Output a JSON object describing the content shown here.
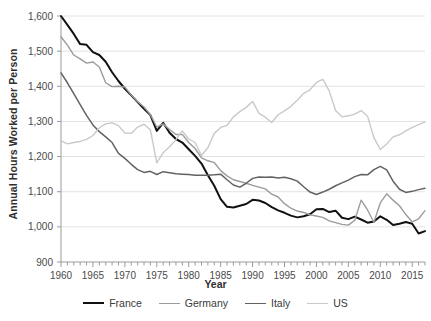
{
  "chart_data": {
    "type": "line",
    "title": "",
    "xlabel": "Year",
    "ylabel": "Annual Hours Worked per Person",
    "xlim": [
      1960,
      2017
    ],
    "ylim": [
      900,
      1600
    ],
    "ytick_step": 100,
    "xtick_step": 1,
    "xtick_label_step": 5,
    "grid": "horizontal",
    "legend_position": "bottom",
    "ytick_labels": [
      "900",
      "1,000",
      "1,100",
      "1,200",
      "1,300",
      "1,400",
      "1,500",
      "1,600"
    ],
    "xtick_labels": [
      "1960",
      "1965",
      "1970",
      "1975",
      "1980",
      "1985",
      "1990",
      "1995",
      "2000",
      "2005",
      "2010",
      "2015"
    ],
    "x": [
      1960,
      1961,
      1962,
      1963,
      1964,
      1965,
      1966,
      1967,
      1968,
      1969,
      1970,
      1971,
      1972,
      1973,
      1974,
      1975,
      1976,
      1977,
      1978,
      1979,
      1980,
      1981,
      1982,
      1983,
      1984,
      1985,
      1986,
      1987,
      1988,
      1989,
      1990,
      1991,
      1992,
      1993,
      1994,
      1995,
      1996,
      1997,
      1998,
      1999,
      2000,
      2001,
      2002,
      2003,
      2004,
      2005,
      2006,
      2007,
      2008,
      2009,
      2010,
      2011,
      2012,
      2013,
      2014,
      2015,
      2016,
      2017
    ],
    "series": [
      {
        "name": "France",
        "color": "#111111",
        "width": 2.0,
        "values": [
          1600,
          1575,
          1549,
          1520,
          1518,
          1497,
          1489,
          1470,
          1440,
          1415,
          1393,
          1374,
          1355,
          1336,
          1318,
          1273,
          1296,
          1268,
          1250,
          1240,
          1221,
          1202,
          1180,
          1147,
          1117,
          1079,
          1057,
          1055,
          1060,
          1065,
          1077,
          1075,
          1068,
          1056,
          1047,
          1040,
          1032,
          1027,
          1030,
          1036,
          1050,
          1051,
          1042,
          1046,
          1026,
          1022,
          1029,
          1021,
          1012,
          1015,
          1030,
          1020,
          1005,
          1009,
          1014,
          1009,
          981,
          988
        ]
      },
      {
        "name": "Germany",
        "color": "#9b9b9b",
        "width": 1.4,
        "values": [
          1541,
          1517,
          1489,
          1478,
          1466,
          1469,
          1455,
          1410,
          1399,
          1400,
          1398,
          1375,
          1356,
          1341,
          1319,
          1284,
          1293,
          1277,
          1263,
          1263,
          1240,
          1223,
          1196,
          1188,
          1183,
          1160,
          1145,
          1134,
          1129,
          1124,
          1118,
          1113,
          1108,
          1093,
          1085,
          1066,
          1053,
          1045,
          1041,
          1034,
          1031,
          1027,
          1017,
          1012,
          1007,
          1005,
          1019,
          1076,
          1048,
          1013,
          1068,
          1094,
          1076,
          1060,
          1035,
          1014,
          1023,
          1046
        ]
      },
      {
        "name": "Italy",
        "color": "#626262",
        "width": 1.5,
        "values": [
          1438,
          1410,
          1379,
          1348,
          1317,
          1290,
          1271,
          1256,
          1240,
          1209,
          1195,
          1178,
          1163,
          1155,
          1158,
          1149,
          1157,
          1154,
          1151,
          1150,
          1149,
          1147,
          1147,
          1147,
          1148,
          1150,
          1134,
          1119,
          1113,
          1124,
          1138,
          1142,
          1141,
          1142,
          1139,
          1141,
          1137,
          1130,
          1114,
          1099,
          1092,
          1099,
          1107,
          1117,
          1125,
          1133,
          1143,
          1149,
          1148,
          1163,
          1172,
          1162,
          1130,
          1107,
          1098,
          1101,
          1106,
          1110
        ]
      },
      {
        "name": "US",
        "color": "#c9c9c9",
        "width": 1.4,
        "values": [
          1245,
          1236,
          1240,
          1243,
          1249,
          1260,
          1282,
          1293,
          1296,
          1288,
          1267,
          1266,
          1284,
          1292,
          1276,
          1182,
          1211,
          1228,
          1248,
          1273,
          1250,
          1240,
          1203,
          1225,
          1266,
          1283,
          1289,
          1313,
          1328,
          1340,
          1357,
          1323,
          1312,
          1297,
          1319,
          1330,
          1343,
          1360,
          1380,
          1390,
          1411,
          1420,
          1387,
          1331,
          1313,
          1316,
          1321,
          1331,
          1315,
          1254,
          1220,
          1236,
          1256,
          1262,
          1273,
          1283,
          1291,
          1299
        ]
      }
    ]
  },
  "legend": {
    "items": [
      {
        "label": "France"
      },
      {
        "label": "Germany"
      },
      {
        "label": "Italy"
      },
      {
        "label": "US"
      }
    ]
  }
}
